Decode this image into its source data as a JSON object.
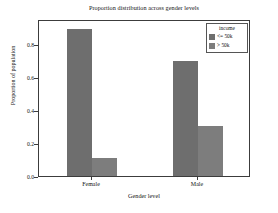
{
  "chart_data": {
    "type": "bar",
    "title": "Proportion distribution across gender levels",
    "xlabel": "Gender level",
    "ylabel": "Proportion of population",
    "categories": [
      "Female",
      "Male"
    ],
    "series": [
      {
        "name": "<= 50k",
        "values": [
          0.89,
          0.695
        ],
        "color": "#6e6e6e"
      },
      {
        "name": "> 50k",
        "values": [
          0.11,
          0.305
        ],
        "color": "#7d7d7d"
      }
    ],
    "ylim": [
      0.0,
      0.95
    ],
    "yticks": [
      "0.0",
      "0.2",
      "0.4",
      "0.6",
      "0.8"
    ],
    "ytick_values": [
      0.0,
      0.2,
      0.4,
      0.6,
      0.8
    ],
    "grid": false,
    "legend": {
      "title": "income",
      "position": "upper right",
      "entries": [
        "<= 50k",
        "> 50k"
      ]
    }
  }
}
